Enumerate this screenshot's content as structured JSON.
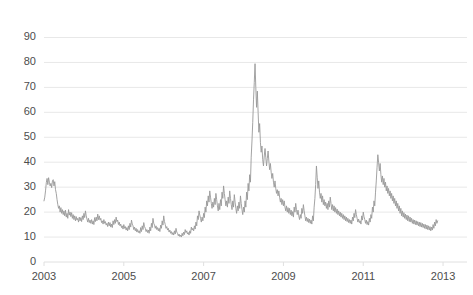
{
  "chart_data": {
    "type": "line",
    "title": "",
    "subtitle": "",
    "xlabel": "",
    "ylabel": "",
    "grid": true,
    "legend": false,
    "legend_position": "none",
    "line_color": "#999999",
    "grid_color": "#e8e8e8",
    "axis_color": "#e0e0e0",
    "tick_label_color": "#4d4d4d",
    "background": "#ffffff",
    "xlim": [
      2003.0,
      2013.6
    ],
    "ylim": [
      0,
      93
    ],
    "yticks": [
      0,
      10,
      20,
      30,
      40,
      50,
      60,
      70,
      80,
      90
    ],
    "ytick_labels": [
      "0",
      "10",
      "20",
      "30",
      "40",
      "50",
      "60",
      "70",
      "80",
      "90"
    ],
    "xticks": [
      2003,
      2005,
      2007,
      2009,
      2011,
      2013
    ],
    "xtick_labels": [
      "2003",
      "2005",
      "2007",
      "2009",
      "2011",
      "2013"
    ],
    "series": [
      {
        "name": "VIX",
        "color": "#999999",
        "x_start": 2003.0,
        "x_step": 0.019230769,
        "values": [
          24.5,
          26.0,
          28.5,
          31.8,
          33.5,
          31.0,
          33.8,
          32.0,
          30.5,
          31.5,
          29.8,
          32.5,
          33.0,
          30.5,
          32.2,
          29.0,
          27.5,
          25.0,
          23.0,
          21.5,
          22.5,
          20.0,
          21.8,
          19.5,
          21.0,
          19.0,
          20.5,
          18.5,
          20.8,
          18.0,
          19.5,
          17.5,
          21.0,
          18.8,
          20.0,
          18.2,
          19.8,
          17.5,
          19.0,
          17.0,
          18.5,
          16.5,
          18.2,
          16.8,
          17.5,
          16.0,
          18.0,
          16.5,
          17.8,
          16.2,
          18.5,
          17.0,
          19.5,
          17.8,
          20.5,
          18.5,
          17.2,
          16.0,
          17.5,
          15.8,
          16.8,
          15.5,
          17.0,
          15.2,
          16.5,
          15.0,
          17.8,
          16.2,
          18.0,
          16.5,
          19.2,
          17.0,
          18.5,
          16.8,
          17.5,
          15.8,
          16.5,
          15.2,
          17.0,
          15.5,
          16.2,
          14.8,
          15.5,
          14.2,
          16.0,
          14.5,
          15.8,
          14.0,
          15.2,
          13.8,
          16.5,
          15.0,
          17.0,
          15.5,
          18.0,
          16.2,
          16.8,
          15.0,
          16.0,
          14.5,
          15.2,
          13.8,
          14.5,
          13.2,
          15.0,
          13.5,
          14.2,
          12.8,
          13.8,
          12.5,
          14.5,
          13.0,
          15.5,
          14.0,
          16.8,
          15.2,
          14.5,
          13.0,
          14.0,
          12.5,
          13.5,
          12.0,
          13.0,
          11.8,
          12.5,
          11.5,
          13.8,
          12.2,
          14.5,
          13.0,
          15.8,
          14.2,
          13.5,
          12.2,
          13.0,
          11.8,
          12.8,
          11.5,
          14.0,
          12.5,
          15.5,
          13.8,
          17.5,
          15.5,
          14.8,
          13.5,
          14.5,
          13.0,
          13.8,
          12.5,
          13.5,
          12.2,
          14.8,
          13.5,
          16.5,
          14.8,
          18.5,
          16.2,
          15.0,
          13.5,
          14.2,
          12.8,
          13.5,
          12.0,
          12.8,
          11.5,
          12.2,
          11.0,
          11.8,
          10.8,
          12.5,
          11.2,
          13.5,
          12.0,
          11.5,
          10.5,
          11.2,
          10.2,
          10.8,
          10.0,
          11.5,
          10.5,
          12.0,
          11.0,
          13.0,
          11.8,
          12.5,
          11.2,
          11.8,
          10.8,
          12.5,
          11.5,
          14.0,
          12.8,
          13.5,
          12.5,
          14.5,
          13.2,
          16.0,
          14.5,
          18.5,
          17.0,
          20.5,
          18.8,
          17.5,
          16.0,
          18.0,
          16.5,
          19.5,
          17.8,
          22.0,
          20.0,
          24.5,
          22.5,
          26.5,
          24.0,
          28.5,
          26.0,
          23.5,
          21.5,
          24.0,
          22.0,
          25.5,
          23.0,
          27.5,
          25.0,
          22.5,
          20.5,
          23.5,
          21.0,
          25.0,
          22.5,
          28.0,
          25.5,
          30.5,
          27.5,
          25.0,
          22.5,
          24.5,
          22.0,
          26.0,
          23.5,
          28.5,
          25.5,
          23.0,
          21.0,
          24.5,
          22.0,
          27.0,
          24.0,
          21.5,
          19.5,
          22.5,
          20.5,
          24.0,
          21.5,
          26.5,
          23.5,
          21.0,
          19.0,
          22.0,
          20.0,
          24.5,
          22.0,
          28.0,
          25.0,
          31.5,
          28.5,
          35.0,
          32.0,
          42.0,
          48.5,
          56.0,
          65.0,
          72.0,
          79.5,
          70.0,
          62.0,
          68.5,
          60.0,
          52.0,
          55.5,
          48.0,
          44.0,
          46.5,
          41.0,
          38.5,
          42.5,
          45.5,
          42.0,
          38.5,
          41.5,
          44.5,
          40.5,
          37.0,
          39.5,
          36.0,
          33.5,
          35.5,
          32.0,
          30.0,
          32.5,
          29.5,
          27.5,
          29.0,
          26.5,
          28.5,
          26.0,
          24.0,
          25.5,
          23.0,
          25.0,
          22.5,
          24.5,
          22.0,
          20.5,
          22.5,
          20.0,
          21.8,
          19.5,
          21.5,
          19.0,
          20.8,
          18.5,
          20.2,
          18.0,
          22.0,
          20.0,
          23.5,
          21.0,
          19.0,
          20.8,
          18.5,
          17.0,
          19.0,
          17.5,
          21.5,
          19.5,
          23.0,
          20.5,
          18.5,
          16.5,
          18.0,
          16.2,
          17.5,
          15.8,
          17.2,
          15.5,
          16.8,
          15.2,
          18.5,
          16.5,
          22.0,
          25.5,
          31.0,
          38.5,
          34.0,
          29.5,
          32.5,
          28.0,
          25.5,
          27.5,
          24.0,
          26.5,
          23.0,
          25.0,
          22.5,
          24.0,
          21.5,
          23.5,
          21.0,
          24.5,
          22.0,
          26.0,
          23.5,
          21.0,
          23.0,
          20.5,
          22.5,
          20.0,
          21.8,
          19.5,
          21.2,
          19.0,
          20.5,
          18.5,
          20.0,
          18.0,
          19.5,
          17.5,
          19.0,
          17.0,
          18.5,
          16.5,
          18.0,
          16.2,
          17.5,
          15.8,
          17.0,
          15.5,
          16.8,
          15.2,
          18.0,
          16.5,
          19.5,
          17.8,
          21.0,
          19.0,
          17.5,
          16.0,
          17.2,
          15.8,
          16.5,
          15.2,
          18.5,
          16.8,
          20.0,
          18.2,
          17.0,
          15.5,
          16.8,
          15.0,
          16.2,
          14.8,
          17.5,
          16.0,
          19.0,
          17.5,
          22.0,
          20.0,
          24.5,
          22.5,
          28.0,
          32.5,
          38.0,
          43.0,
          40.0,
          36.5,
          39.5,
          35.0,
          32.0,
          34.5,
          31.0,
          33.5,
          30.0,
          32.0,
          28.5,
          30.5,
          27.5,
          29.5,
          26.5,
          28.5,
          25.5,
          27.5,
          24.5,
          26.5,
          23.5,
          25.5,
          22.5,
          24.5,
          21.5,
          23.5,
          20.5,
          22.5,
          19.5,
          21.5,
          18.5,
          20.5,
          18.0,
          19.8,
          17.5,
          19.2,
          17.0,
          18.8,
          16.5,
          18.5,
          16.2,
          18.0,
          16.0,
          17.5,
          15.5,
          17.0,
          15.2,
          16.8,
          15.0,
          16.5,
          14.8,
          16.2,
          14.5,
          16.0,
          14.2,
          15.8,
          14.0,
          15.5,
          13.8,
          15.2,
          13.5,
          15.0,
          13.2,
          14.8,
          13.0,
          14.5,
          12.8,
          14.2,
          12.5,
          14.0,
          12.8,
          15.0,
          13.5,
          16.0,
          14.5,
          17.0,
          15.5,
          16.5
        ]
      }
    ]
  }
}
